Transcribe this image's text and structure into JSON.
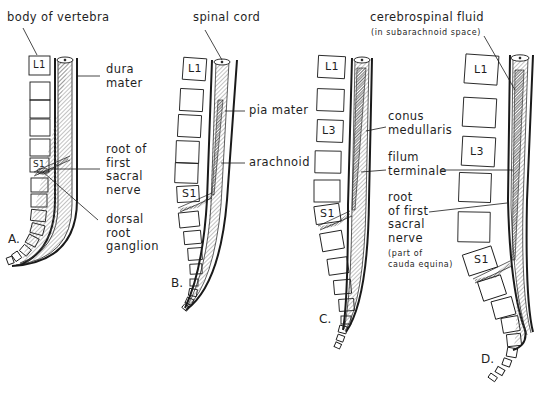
{
  "figure": {
    "panels": [
      {
        "letter": "A.",
        "labels": {
          "body_of_vertebra": "body of vertebra",
          "dura_mater": "dura\nmater",
          "root_first_sacral": "root of\nfirst\nsacral\nnerve",
          "dorsal_root_ganglion": "dorsal\nroot\nganglion"
        },
        "vertebra_tags": [
          "L1",
          "S1"
        ]
      },
      {
        "letter": "B.",
        "labels": {
          "spinal_cord": "spinal cord",
          "pia_mater": "pia mater",
          "arachnoid": "arachnoid"
        },
        "vertebra_tags": [
          "L1",
          "S1"
        ]
      },
      {
        "letter": "C.",
        "labels": {
          "conus_medullaris": "conus\nmedullaris",
          "filum_terminale": "filum\nterminale",
          "root_first_sacral": "root\nof first\nsacral\nnerve",
          "cauda_equina_note": "(part of\ncauda equina)"
        },
        "vertebra_tags": [
          "L1",
          "L3",
          "S1"
        ]
      },
      {
        "letter": "D.",
        "labels": {
          "csf": "cerebrospinal fluid",
          "csf_note": "(in subarachnoid space)"
        },
        "vertebra_tags": [
          "L1",
          "L3",
          "S1"
        ]
      }
    ],
    "colors": {
      "ink": "#1a1a1a",
      "background": "#ffffff",
      "hatch": "#555555"
    }
  }
}
